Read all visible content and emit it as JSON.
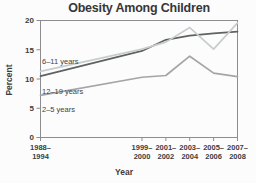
{
  "chart_data": {
    "type": "line",
    "title": "Obesity Among Children",
    "xlabel": "Year",
    "ylabel": "Percent",
    "ylim": [
      0,
      20
    ],
    "y_ticks": [
      0,
      5,
      10,
      15,
      20
    ],
    "grid": false,
    "legend_position": "inline-labels-near-lines",
    "x_tick_labels": [
      [
        "1988–",
        "1994"
      ],
      [
        "1999–",
        "2000"
      ],
      [
        "2001–",
        "2002"
      ],
      [
        "2003–",
        "2004"
      ],
      [
        "2005–",
        "2006"
      ],
      [
        "2007–",
        "2008"
      ]
    ],
    "x_numeric": [
      1991,
      1999.5,
      2001.5,
      2003.5,
      2005.5,
      2007.5
    ],
    "series": [
      {
        "name": "6–11 years",
        "values": [
          11.3,
          15.1,
          16.3,
          18.8,
          15.1,
          19.6
        ],
        "color": "#c9cccd"
      },
      {
        "name": "12–19 years",
        "values": [
          10.5,
          14.8,
          16.7,
          17.4,
          17.8,
          18.1
        ],
        "color": "#5f6163"
      },
      {
        "name": "2–5 years",
        "values": [
          7.2,
          10.3,
          10.6,
          13.9,
          11.0,
          10.4
        ],
        "color": "#a3a6a8"
      }
    ],
    "colors": {
      "frame": "#8b8d90",
      "tick": "#8b8d90",
      "text": "#3c3d3f",
      "background": "#fcfcfc"
    }
  }
}
